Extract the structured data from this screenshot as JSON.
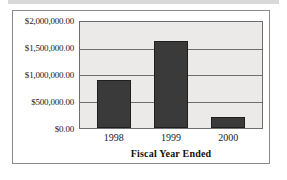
{
  "figure": {
    "frame_color": "#8a8a8a",
    "plot_background": "#eceae8",
    "bar_color": "#3a3a3a",
    "gridline_color": "#6e6e6e"
  },
  "chart_data": {
    "type": "bar",
    "title": "",
    "xlabel": "Fiscal Year Ended",
    "ylabel": "",
    "categories": [
      "1998",
      "1999",
      "2000"
    ],
    "values": [
      900000,
      1650000,
      200000
    ],
    "ylim": [
      0,
      2000000
    ],
    "yticks": [
      0,
      500000,
      1000000,
      1500000,
      2000000
    ],
    "ytick_labels": [
      "$0.00",
      "$500,000.00",
      "$1,000,000.00",
      "$1,500,000.00",
      "$2,000,000.00"
    ],
    "grid": true,
    "legend": false,
    "legend_position": "none"
  }
}
